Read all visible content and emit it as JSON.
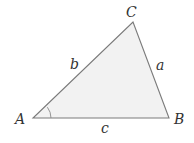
{
  "diagram": {
    "type": "triangle",
    "vertices": {
      "A": {
        "label": "A"
      },
      "B": {
        "label": "B"
      },
      "C": {
        "label": "C"
      }
    },
    "sides": {
      "a": {
        "label": "a",
        "between": "B-C"
      },
      "b": {
        "label": "b",
        "between": "A-C"
      },
      "c": {
        "label": "c",
        "between": "A-B"
      }
    },
    "angle_marker": "A",
    "colors": {
      "fill": "#f2f2f2",
      "stroke": "#7a7a7a",
      "text": "#333333"
    }
  }
}
